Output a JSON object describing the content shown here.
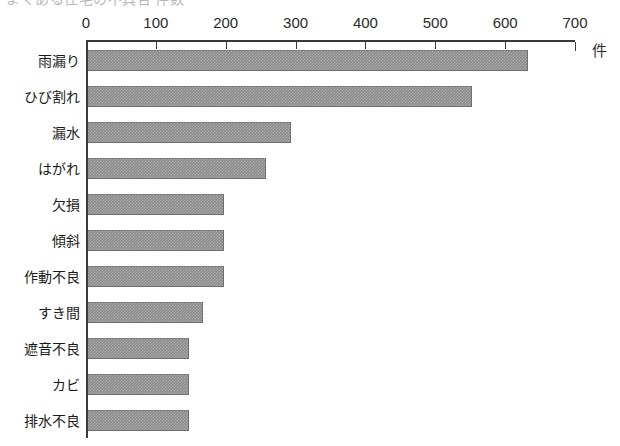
{
  "caption": {
    "clipped_top_text": "よくある住宅の不具合 件数"
  },
  "chart_data": {
    "type": "bar",
    "orientation": "horizontal",
    "title": "",
    "xlabel": "件",
    "ylabel": "",
    "xlim": [
      0,
      700
    ],
    "xticks": [
      0,
      100,
      200,
      300,
      400,
      500,
      600,
      700
    ],
    "grid": false,
    "legend": false,
    "bar_color": "#8a8a8a",
    "axis_color": "#3a3a3a",
    "categories": [
      "雨漏り",
      "ひび割れ",
      "漏水",
      "はがれ",
      "欠損",
      "傾斜",
      "作動不良",
      "すき間",
      "遮音不良",
      "カビ",
      "排水不良"
    ],
    "values": [
      630,
      550,
      290,
      255,
      195,
      195,
      195,
      165,
      145,
      145,
      145
    ],
    "unit": "件"
  }
}
